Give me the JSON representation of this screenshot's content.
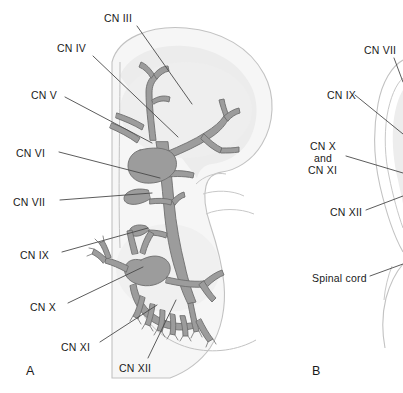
{
  "figure": {
    "panels": [
      {
        "id": "A",
        "marker": "A",
        "marker_x": 26,
        "marker_y": 364,
        "labels": [
          {
            "name": "cn-iii",
            "text": "CN III",
            "x": 104,
            "y": 12,
            "align": "left",
            "line": [
              [
                137,
                26
              ],
              [
                192,
                104
              ]
            ]
          },
          {
            "name": "cn-iv",
            "text": "CN IV",
            "x": 57,
            "y": 42,
            "align": "left",
            "line": [
              [
                93,
                56
              ],
              [
                178,
                137
              ]
            ]
          },
          {
            "name": "cn-v",
            "text": "CN V",
            "x": 31,
            "y": 89,
            "align": "left",
            "line": [
              [
                65,
                97
              ],
              [
                152,
                143
              ]
            ]
          },
          {
            "name": "cn-vi",
            "text": "CN VI",
            "x": 16,
            "y": 147,
            "align": "left",
            "line": [
              [
                59,
                152
              ],
              [
                160,
                178
              ]
            ]
          },
          {
            "name": "cn-vii",
            "text": "CN VII",
            "x": 13,
            "y": 196,
            "align": "left",
            "line": [
              [
                60,
                200
              ],
              [
                152,
                193
              ]
            ]
          },
          {
            "name": "cn-ix",
            "text": "CN IX",
            "x": 20,
            "y": 249,
            "align": "left",
            "line": [
              [
                62,
                252
              ],
              [
                148,
                228
              ]
            ]
          },
          {
            "name": "cn-x",
            "text": "CN X",
            "x": 30,
            "y": 301,
            "align": "left",
            "line": [
              [
                68,
                303
              ],
              [
                143,
                267
              ]
            ]
          },
          {
            "name": "cn-xi",
            "text": "CN XI",
            "x": 61,
            "y": 341,
            "align": "left",
            "line": [
              [
                100,
                342
              ],
              [
                157,
                305
              ]
            ]
          },
          {
            "name": "cn-xii",
            "text": "CN XII",
            "x": 119,
            "y": 362,
            "align": "left",
            "line": [
              [
                148,
                358
              ],
              [
                176,
                300
              ]
            ]
          }
        ]
      },
      {
        "id": "B",
        "marker": "B",
        "marker_x": 312,
        "marker_y": 364,
        "labels": [
          {
            "name": "cn-vii-b",
            "text": "CN VII",
            "x": 364,
            "y": 44,
            "align": "left",
            "line": [
              [
                394,
                58
              ],
              [
                403,
                82
              ]
            ]
          },
          {
            "name": "cn-ix-b",
            "text": "CN IX",
            "x": 327,
            "y": 89,
            "align": "left",
            "line": [
              [
                355,
                95
              ],
              [
                403,
                134
              ]
            ]
          },
          {
            "name": "cn-x-b",
            "text": "CN X",
            "x": 310,
            "y": 140,
            "align": "left",
            "line": null
          },
          {
            "name": "and-b",
            "text": "and",
            "x": 314,
            "y": 152,
            "align": "left",
            "line": [
              [
                346,
                156
              ],
              [
                403,
                173
              ]
            ]
          },
          {
            "name": "cn-xi-b",
            "text": "CN XI",
            "x": 308,
            "y": 164,
            "align": "left",
            "line": null
          },
          {
            "name": "cn-xii-b",
            "text": "CN XII",
            "x": 330,
            "y": 206,
            "align": "left",
            "line": [
              [
                366,
                210
              ],
              [
                403,
                196
              ]
            ]
          },
          {
            "name": "spinal-cord-b",
            "text": "Spinal cord",
            "x": 312,
            "y": 272,
            "align": "left",
            "line": [
              [
                370,
                276
              ],
              [
                403,
                264
              ]
            ]
          }
        ]
      }
    ],
    "colors": {
      "nerve_fill": "#9c9c9c",
      "nerve_stroke": "#707070",
      "head_outline": "#b4b4b4",
      "brain_shade": "#e9e9e9",
      "body_shade": "#f2f2f2",
      "leader_line": "#4a4a4a",
      "label_text": "#1a1a1a",
      "background": "#ffffff"
    },
    "caption_note": "Schematic lateral view of cranial nerve origins; panel B cropped at image edge."
  }
}
